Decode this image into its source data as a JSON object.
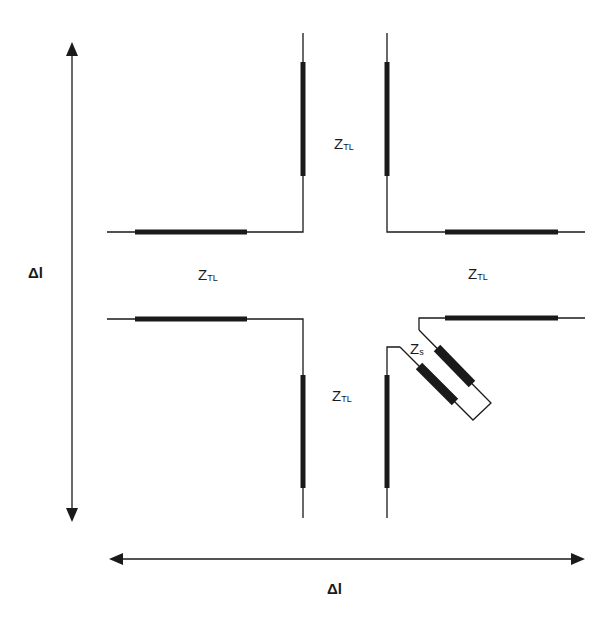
{
  "diagram": {
    "type": "microstrip cross-junction unit cell with stub",
    "labels": {
      "z_top": {
        "main": "Z",
        "sub": "TL"
      },
      "z_left": {
        "main": "Z",
        "sub": "TL"
      },
      "z_right": {
        "main": "Z",
        "sub": "TL"
      },
      "z_bottom": {
        "main": "Z",
        "sub": "TL"
      },
      "z_stub": {
        "main": "Z",
        "sub": "s"
      },
      "delta_vertical": "Δl",
      "delta_horizontal": "Δl"
    },
    "colors": {
      "line": "#1a1a1a",
      "background": "#ffffff"
    }
  }
}
